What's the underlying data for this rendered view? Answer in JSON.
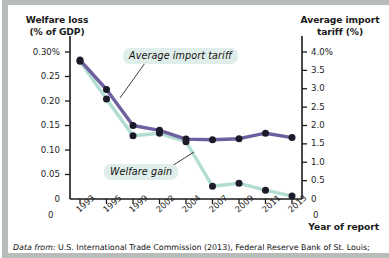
{
  "figure": {
    "left_axis_title": "Welfare loss\n(% of GDP)",
    "left_axis_title_line1": "Welfare loss",
    "left_axis_title_line2": "(% of GDP)",
    "right_axis_title_line1": "Average import",
    "right_axis_title_line2": "tariff (%)",
    "x_axis_title": "Year of report",
    "source_lead": "Data from:",
    "source_text": " U.S. International Trade Commission (2013), Federal Reserve Bank of St. Louis;",
    "colors": {
      "tariff_line": "#6e5f9e",
      "welfare_line": "#b2ddd3",
      "marker": "#1b1b2a",
      "axis": "#1b1b1b",
      "callout_bg": "#dfeeea",
      "background": "#ffffff",
      "page_edge": "#b9bdba"
    }
  },
  "chart_data": {
    "type": "line",
    "title": "",
    "xlabel": "Year of report",
    "categories": [
      "1993",
      "1995",
      "1999",
      "2002",
      "2004",
      "2007",
      "2009",
      "2011",
      "2013"
    ],
    "left_axis": {
      "label_line1": "Welfare loss",
      "label_line2": "(% of GDP)",
      "ticks": [
        "0.30%",
        "0.25",
        "0.20",
        "0.15",
        "0.10",
        "0.05",
        "0"
      ],
      "tick_values": [
        0.3,
        0.25,
        0.2,
        0.15,
        0.1,
        0.05,
        0
      ],
      "ylim": [
        0,
        0.3
      ],
      "unit": "% of GDP"
    },
    "right_axis": {
      "label_line1": "Average import",
      "label_line2": "tariff (%)",
      "ticks": [
        "4.0%",
        "3.5",
        "3.0",
        "2.5",
        "2.0",
        "1.5",
        "1.0",
        "0.5",
        "0"
      ],
      "tick_values": [
        4.0,
        3.5,
        3.0,
        2.5,
        2.0,
        1.5,
        1.0,
        0.5,
        0
      ],
      "ylim": [
        0,
        4.0
      ],
      "unit": "%"
    },
    "grid": false,
    "legend": "annotations",
    "series": [
      {
        "name": "Average import tariff",
        "axis": "right",
        "color": "#6e5f9e",
        "annotation": "Average import tariff",
        "values": [
          3.78,
          2.98,
          2.0,
          1.87,
          1.63,
          1.61,
          1.64,
          1.79,
          1.67
        ]
      },
      {
        "name": "Welfare gain",
        "axis": "left",
        "color": "#b2ddd3",
        "annotation": "Welfare gain",
        "values": [
          0.281,
          0.204,
          0.129,
          0.134,
          0.117,
          0.026,
          0.032,
          0.018,
          0.006
        ]
      }
    ]
  }
}
